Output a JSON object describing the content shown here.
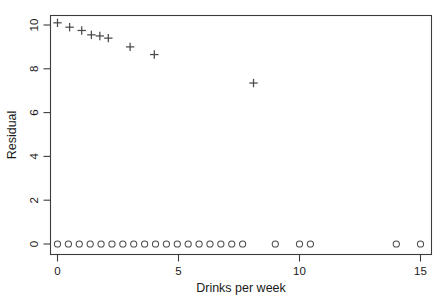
{
  "figure": {
    "background_color": "#ffffff",
    "marker_color": "#4a4a4a",
    "axis_color": "#3c3c3c"
  },
  "chart_data": {
    "type": "scatter",
    "title": "",
    "xlabel": "Drinks per week",
    "ylabel": "Residual",
    "xlim": [
      -0.55,
      15.6
    ],
    "ylim": [
      -0.55,
      10.6
    ],
    "xticks": [
      0,
      5,
      10,
      15
    ],
    "xticklabels": [
      "0",
      "5",
      "10",
      "15"
    ],
    "yticks": [
      0,
      2,
      4,
      6,
      8,
      10
    ],
    "yticklabels": [
      "0",
      "2",
      "4",
      "6",
      "8",
      "10"
    ],
    "grid": false,
    "legend": null,
    "series": [
      {
        "name": "upper-group",
        "marker": "plus",
        "x": [
          0.0,
          0.5,
          1.0,
          1.4,
          1.75,
          2.1,
          3.0,
          4.0,
          8.1
        ],
        "y": [
          10.1,
          9.9,
          9.75,
          9.55,
          9.5,
          9.4,
          9.0,
          8.65,
          7.35
        ]
      },
      {
        "name": "zero-group",
        "marker": "circle",
        "x": [
          0.0,
          0.45,
          0.9,
          1.35,
          1.8,
          2.25,
          2.7,
          3.15,
          3.6,
          4.05,
          4.5,
          4.95,
          5.4,
          5.85,
          6.3,
          6.75,
          7.2,
          7.65,
          9.0,
          10.0,
          10.45,
          14.0,
          15.0
        ],
        "y": [
          0,
          0,
          0,
          0,
          0,
          0,
          0,
          0,
          0,
          0,
          0,
          0,
          0,
          0,
          0,
          0,
          0,
          0,
          0,
          0,
          0,
          0,
          0
        ]
      }
    ]
  }
}
